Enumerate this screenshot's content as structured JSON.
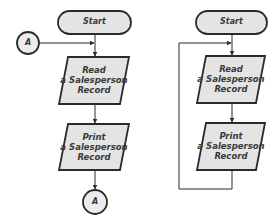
{
  "colors": {
    "stroke": "#2a2a2a",
    "fill": "#e4e4e4",
    "connector_fill": "#ececec",
    "text": "#3a3a3a",
    "background": "#ffffff"
  },
  "left_flowchart": {
    "start": {
      "label": "Start"
    },
    "entry_connector": {
      "label": "A"
    },
    "read_step": {
      "line1": "Read",
      "line2": "a Salesperson",
      "line3": "Record"
    },
    "print_step": {
      "line1": "Print",
      "line2": "a Salesperson",
      "line3": "Record"
    },
    "exit_connector": {
      "label": "A"
    }
  },
  "right_flowchart": {
    "start": {
      "label": "Start"
    },
    "read_step": {
      "line1": "Read",
      "line2": "a Salesperson",
      "line3": "Record"
    },
    "print_step": {
      "line1": "Print",
      "line2": "a Salesperson",
      "line3": "Record"
    }
  }
}
